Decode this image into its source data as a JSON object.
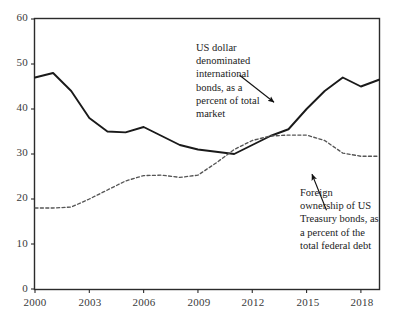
{
  "chart_data": {
    "type": "line",
    "title": "",
    "subtitle": "",
    "xlabel": "",
    "ylabel": "",
    "xlim": [
      2000,
      2019
    ],
    "ylim": [
      0,
      60
    ],
    "grid": false,
    "legend_position": "none",
    "x_tick_labels": [
      "2000",
      "2003",
      "2006",
      "2009",
      "2012",
      "2015",
      "2018"
    ],
    "x_tick_values": [
      2000,
      2003,
      2006,
      2009,
      2012,
      2015,
      2018
    ],
    "y_tick_labels": [
      "0",
      "10",
      "20",
      "30",
      "40",
      "50",
      "60"
    ],
    "y_tick_values": [
      0,
      10,
      20,
      30,
      40,
      50,
      60
    ],
    "x": [
      2000,
      2001,
      2002,
      2003,
      2004,
      2005,
      2006,
      2007,
      2008,
      2009,
      2010,
      2011,
      2012,
      2013,
      2014,
      2015,
      2016,
      2017,
      2018,
      2019
    ],
    "series": [
      {
        "name": "US dollar denominated international bonds, as a percent of total market",
        "style": "solid",
        "color": "#1a1a1a",
        "values": [
          47.0,
          48.0,
          44.0,
          38.0,
          35.0,
          34.8,
          36.0,
          34.0,
          32.0,
          31.0,
          30.5,
          30.0,
          32.0,
          34.0,
          35.5,
          40.0,
          44.0,
          47.0,
          45.0,
          46.5
        ]
      },
      {
        "name": "Foreign ownership of US Treasury bonds, as a percent of the total federal debt",
        "style": "dashed",
        "color": "#555555",
        "values": [
          18.0,
          18.0,
          18.2,
          20.0,
          22.0,
          24.0,
          25.2,
          25.3,
          24.8,
          25.3,
          28.0,
          31.0,
          33.0,
          34.0,
          34.2,
          34.2,
          33.0,
          30.2,
          29.5,
          29.5
        ]
      }
    ],
    "annotations": [
      {
        "id": "bonds",
        "text": "US dollar\ndenominated\ninternational\nbonds, as a\npercent of total\nmarket",
        "arrow_from": [
          2011.3,
          47.5
        ],
        "arrow_to": [
          2013.2,
          41.5
        ]
      },
      {
        "id": "treasury",
        "text": "Foreign\nownership of US\nTreasury bonds, as\na percent of the\ntotal federal debt",
        "arrow_from": [
          2016.1,
          17.5
        ],
        "arrow_to": [
          2015.3,
          25.5
        ]
      }
    ]
  },
  "axes": {
    "frame_color": "#2b2b2b",
    "background": "#ffffff"
  }
}
